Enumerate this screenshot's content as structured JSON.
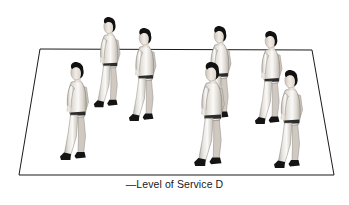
{
  "figure": {
    "caption": "—Level of Service D",
    "background_color": "#ffffff",
    "line_color": "#1a1a1a",
    "medium": "grayscale line and tone illustration"
  },
  "ground_plane": {
    "name": "pedestrian-walkway-plane",
    "shape": "trapezoid",
    "stroke_color": "#1a1a1a",
    "stroke_width": 1,
    "fill": "none",
    "corners": {
      "top_left": [
        40,
        49
      ],
      "top_right": [
        312,
        50
      ],
      "bottom_right": [
        334,
        175
      ],
      "bottom_left": [
        19,
        175
      ]
    },
    "points": "40,49 312,50 334,175 19,175"
  },
  "palette": {
    "hair": "#111111",
    "shoe": "#141414",
    "belt": "#1c1c1c",
    "skin_light": "#f2ece6",
    "skin_shadow": "#cdc4bb",
    "garment_light": "#fbfaf8",
    "garment_mid": "#e2ded8",
    "garment_shadow": "#b9b3ab",
    "outline": "#6e6a65"
  },
  "pedestrians": [
    {
      "id": 1,
      "name": "pedestrian-left-front",
      "label": "Walking pedestrian, left foreground",
      "x": 58,
      "y": 62,
      "scale": 1.0,
      "facing": "left",
      "depth": "front"
    },
    {
      "id": 2,
      "name": "pedestrian-left-back",
      "label": "Walking pedestrian, left background",
      "x": 92,
      "y": 17,
      "scale": 0.92,
      "facing": "left",
      "depth": "back"
    },
    {
      "id": 3,
      "name": "pedestrian-left-mid",
      "label": "Walking pedestrian, left middle",
      "x": 127,
      "y": 28,
      "scale": 0.95,
      "facing": "left",
      "depth": "mid"
    },
    {
      "id": 4,
      "name": "pedestrian-center-back",
      "label": "Walking pedestrian, center background",
      "x": 202,
      "y": 26,
      "scale": 0.95,
      "facing": "left",
      "depth": "back"
    },
    {
      "id": 5,
      "name": "pedestrian-center-front",
      "label": "Walking pedestrian, center foreground",
      "x": 192,
      "y": 62,
      "scale": 1.06,
      "facing": "left",
      "depth": "front"
    },
    {
      "id": 6,
      "name": "pedestrian-right-back",
      "label": "Walking pedestrian, right background",
      "x": 253,
      "y": 31,
      "scale": 0.95,
      "facing": "left",
      "depth": "back"
    },
    {
      "id": 7,
      "name": "pedestrian-right-front",
      "label": "Walking pedestrian, right foreground",
      "x": 272,
      "y": 70,
      "scale": 1.0,
      "facing": "left",
      "depth": "front"
    }
  ]
}
